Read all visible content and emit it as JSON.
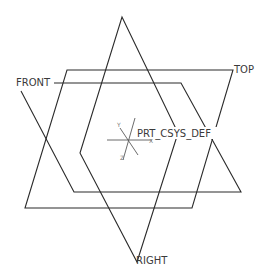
{
  "viewport": {
    "width": 266,
    "height": 279,
    "background": "#ffffff"
  },
  "planes": [
    {
      "name": "FRONT",
      "label": "FRONT"
    },
    {
      "name": "TOP",
      "label": "TOP"
    },
    {
      "name": "RIGHT",
      "label": "RIGHT"
    }
  ],
  "csys": {
    "label": "PRT_CSYS_DEF",
    "axes": {
      "x": "X",
      "y": "Y",
      "z": "Z"
    }
  },
  "colors": {
    "line": "#2b2b2b",
    "axis": "#5a5a5a",
    "text": "#3a3a3a"
  }
}
